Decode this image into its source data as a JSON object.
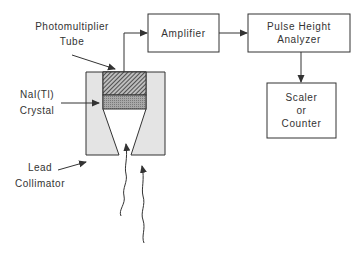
{
  "diagram": {
    "labels": {
      "pmt_line1": "Photomultiplier",
      "pmt_line2": "Tube",
      "crystal_line1": "NaI(Tl)",
      "crystal_line2": "Crystal",
      "collimator_line1": "Lead",
      "collimator_line2": "Collimator"
    },
    "boxes": {
      "amplifier": "Amplifier",
      "pha_line1": "Pulse Height",
      "pha_line2": "Analyzer",
      "scaler_line1": "Scaler",
      "scaler_line2": "or",
      "scaler_line3": "Counter"
    },
    "colors": {
      "line": "#333333",
      "collimator_fill": "#e4e4e4",
      "crystal_fill": "#9a9a9a",
      "pmt_hatch": "#444444"
    }
  }
}
